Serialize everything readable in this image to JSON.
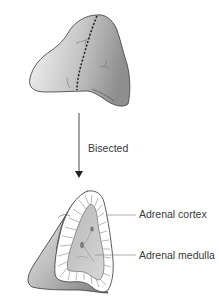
{
  "diagram": {
    "step_label": "Bisected",
    "labels": [
      {
        "id": "cortex",
        "text": "Adrenal cortex"
      },
      {
        "id": "medulla",
        "text": "Adrenal medulla"
      }
    ],
    "colors": {
      "outline": "#4a4a4a",
      "organ_light": "#f0f0f0",
      "organ_dark": "#9a9a9a",
      "cortex": "#ffffff",
      "medulla": "#c8c8c8",
      "leader": "#8a8a8a",
      "arrow": "#333333"
    }
  }
}
